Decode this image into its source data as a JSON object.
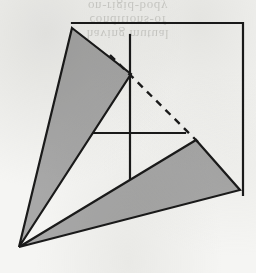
{
  "page": {
    "background_color": "#f5f5f3",
    "width": 256,
    "height": 273
  },
  "bleed_through_text": {
    "line1": "on-rigid-body",
    "line2": "conditions-of",
    "line3": "having mutual"
  },
  "figure": {
    "stroke_color": "#1a1a1a",
    "fill_color": "#a8a8a8",
    "frame": {
      "name": "partial-border-frame",
      "top_y": 23,
      "top_x_start": 72,
      "top_x_end": 243,
      "right_x": 243,
      "right_y_end": 195
    },
    "axes": {
      "vertical": {
        "x": 130,
        "y_top": 35,
        "y_bottom": 190
      },
      "horizontal": {
        "y": 133,
        "x_left": 78,
        "x_right": 185
      }
    },
    "shapes": [
      {
        "name": "left-wedge-triangle",
        "type": "triangle",
        "fill": "#a8a8a8",
        "points": "72,28 131,74 19,247"
      },
      {
        "name": "right-wedge-triangle",
        "type": "triangle",
        "fill": "#a8a8a8",
        "points": "196,140 240,190 19,247"
      }
    ],
    "dashed_line": {
      "name": "construction-dashed-line",
      "x1": 110,
      "y1": 55,
      "x2": 198,
      "y2": 142,
      "dash_pattern": "7 6"
    },
    "apex_point": {
      "x": 19,
      "y": 247
    }
  }
}
